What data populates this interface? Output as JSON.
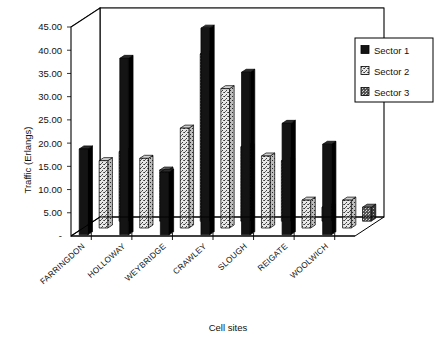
{
  "chart_data": {
    "type": "bar",
    "title": "",
    "subtitle": "",
    "xlabel": "Cell sites",
    "ylabel": "Traffic  (Erlangs)",
    "categories": [
      "FARRINGDON",
      "HOLLOWAY",
      "WEYBRIDGE",
      "CRAWLEY",
      "SLOUGH",
      "REIGATE",
      "WOOLWICH"
    ],
    "series": [
      {
        "name": "Sector 1",
        "values": [
          18.5,
          38.0,
          13.5,
          44.5,
          35.0,
          24.0,
          19.5
        ],
        "color": "#141414",
        "pattern": "solid"
      },
      {
        "name": "Sector 2",
        "values": [
          14.5,
          15.0,
          21.5,
          30.0,
          15.5,
          6.0,
          6.0
        ],
        "color": "#d9d9d9",
        "pattern": "light-stipple"
      },
      {
        "name": "Sector 3",
        "values": [
          15.0,
          11.0,
          36.0,
          16.0,
          13.0,
          3.0,
          3.0
        ],
        "color": "#4a4a4a",
        "pattern": "dark-stipple"
      }
    ],
    "ytick_labels": [
      "45.00",
      "40.00",
      "35.00",
      "30.00",
      "25.00",
      "20.00",
      "15.00",
      "10.00",
      "5.00",
      "-"
    ],
    "ytick_values": [
      45,
      40,
      35,
      30,
      25,
      20,
      15,
      10,
      5,
      0
    ],
    "ylim": [
      0,
      45
    ],
    "grid": true,
    "grid_axis": "y",
    "projection": "3d",
    "legend": {
      "position": "top-right",
      "entries": [
        "Sector 1",
        "Sector 2",
        "Sector 3"
      ]
    }
  },
  "legend": {
    "items": [
      {
        "label": "Sector 1"
      },
      {
        "label": "Sector 2"
      },
      {
        "label": "Sector 3"
      }
    ]
  },
  "axes": {
    "y_title": "Traffic  (Erlangs)",
    "x_title": "Cell sites"
  }
}
